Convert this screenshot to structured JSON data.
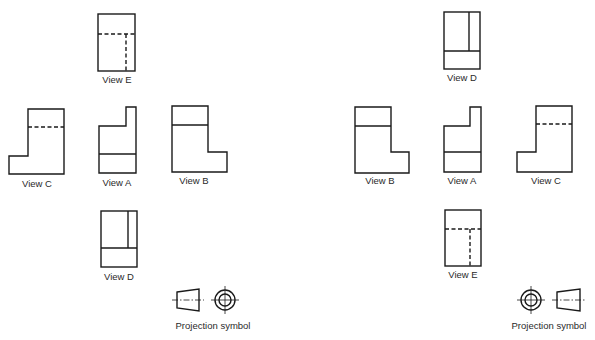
{
  "diagram": {
    "left_panel": {
      "projection": "first-angle",
      "views": {
        "E": {
          "label": "View E"
        },
        "C": {
          "label": "View C"
        },
        "A": {
          "label": "View A"
        },
        "B": {
          "label": "View B"
        },
        "D": {
          "label": "View D"
        }
      },
      "symbol_label": "Projection symbol"
    },
    "right_panel": {
      "projection": "third-angle",
      "views": {
        "D": {
          "label": "View D"
        },
        "B": {
          "label": "View B"
        },
        "A": {
          "label": "View A"
        },
        "C": {
          "label": "View C"
        },
        "E": {
          "label": "View E"
        }
      },
      "symbol_label": "Projection symbol"
    },
    "colors": {
      "line": "#1a1a1a",
      "text": "#2a2a2a",
      "background": "#ffffff"
    }
  }
}
